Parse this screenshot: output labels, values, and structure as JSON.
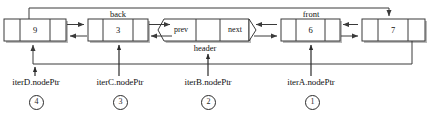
{
  "diagram": {
    "line_color": "#3a3a3a",
    "box_fill": "#ffffff",
    "shadow_color": "#b9b9b9",
    "text_color": "#111111"
  },
  "nodes": [
    {
      "id": "node-9",
      "value": "9",
      "top_label": "",
      "shape": "box"
    },
    {
      "id": "node-3",
      "value": "3",
      "top_label": "back",
      "shape": "box"
    },
    {
      "id": "node-header",
      "value": "",
      "top_label": "",
      "bottom_label": "header",
      "shape": "hexagon",
      "left_cell": "prev",
      "right_cell": "next"
    },
    {
      "id": "node-6",
      "value": "6",
      "top_label": "front",
      "shape": "box"
    },
    {
      "id": "node-7",
      "value": "7",
      "top_label": "",
      "shape": "box"
    }
  ],
  "pointers": [
    {
      "id": "iterD",
      "label": "iterD.nodePtr",
      "number": "4",
      "target": "node-9"
    },
    {
      "id": "iterC",
      "label": "iterC.nodePtr",
      "number": "3",
      "target": "node-3"
    },
    {
      "id": "iterB",
      "label": "iterB.nodePtr",
      "number": "2",
      "target": "node-header"
    },
    {
      "id": "iterA",
      "label": "iterA.nodePtr",
      "number": "1",
      "target": "node-6"
    }
  ]
}
